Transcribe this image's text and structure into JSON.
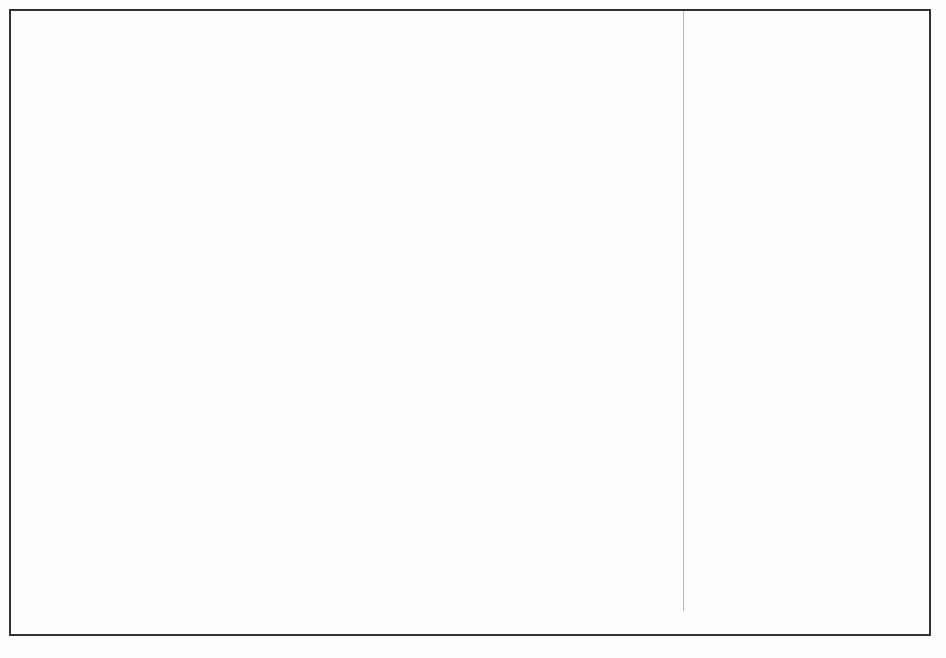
{
  "figure": {
    "caption": "Marine fishes not identified: 0.5%"
  },
  "chart_data": {
    "type": "area",
    "xlabel": "",
    "ylabel": "mt",
    "categories": [
      "1990",
      "1991",
      "1992",
      "1993",
      "1994",
      "1995",
      "1996",
      "1997",
      "1998",
      "1999"
    ],
    "x_tick_labels": [
      "1990",
      "1991",
      "1992",
      "1993",
      "1994",
      "1995",
      "1996",
      "1997",
      "1998",
      "1999"
    ],
    "y_tick_labels": [
      "0",
      "300,000",
      "600,000",
      "900,000",
      "1,200,000",
      "1,500,000",
      "1,800,000"
    ],
    "y_tick_values": [
      0,
      300000,
      600000,
      900000,
      1200000,
      1500000,
      1800000
    ],
    "ylim": [
      0,
      1800000
    ],
    "grid": false,
    "legend_position": "right",
    "stacked": true,
    "series": [
      {
        "name": "Molluscs",
        "color": "#f2f2f2",
        "values": [
          70000,
          55000,
          60000,
          62000,
          66000,
          70000,
          68000,
          66000,
          64000,
          62000
        ]
      },
      {
        "name": "Crustaceans",
        "color": "#bcbcbc",
        "values": [
          150000,
          155000,
          160000,
          168000,
          178000,
          190000,
          190000,
          196000,
          208000,
          216000
        ]
      },
      {
        "name": "Sharks, rays, chimaeras",
        "color": "#fbfbfb",
        "values": [
          12000,
          12000,
          13000,
          14000,
          15000,
          16000,
          16000,
          16000,
          17000,
          18000
        ]
      },
      {
        "name": "Miscellaneous pelagic fishes",
        "color": "#ffffff",
        "values": [
          82000,
          70000,
          60000,
          52000,
          46000,
          40000,
          40000,
          42000,
          46000,
          48000
        ]
      },
      {
        "name": "Tunas, bonitos, billfishes",
        "color": "#e8e8e8",
        "values": [
          6000,
          6000,
          6000,
          6000,
          6000,
          6000,
          6000,
          6000,
          6000,
          6000
        ]
      },
      {
        "name": "Herrings, sardines, anchovies",
        "color": "#8e8e8e",
        "values": [
          290000,
          240000,
          205000,
          190000,
          185000,
          180000,
          182000,
          186000,
          196000,
          200000
        ]
      },
      {
        "name": "Miscellaneous demersal fishes",
        "color": "#a8a8a8",
        "values": [
          65000,
          60000,
          58000,
          56000,
          55000,
          54000,
          55000,
          56000,
          58000,
          60000
        ]
      },
      {
        "name": "Miscellaneous coastal fishes",
        "color": "#fafafa",
        "values": [
          8000,
          8000,
          8000,
          8000,
          8000,
          8000,
          8000,
          8000,
          8000,
          8000
        ]
      },
      {
        "name": "Cods, hakes, haddocks",
        "color": "#cfcfcf",
        "values": [
          755000,
          545000,
          425000,
          320000,
          225000,
          160000,
          165000,
          175000,
          185000,
          180000
        ]
      },
      {
        "name": "Flounders, halibuts, soles",
        "color": "#ffffff",
        "values": [
          130000,
          110000,
          92000,
          78000,
          62000,
          48000,
          46000,
          45000,
          48000,
          50000
        ]
      },
      {
        "name": "Freshwater and diadromous fishes",
        "color": "#f7f7f7",
        "values": [
          12000,
          11000,
          10000,
          9000,
          8000,
          8000,
          8000,
          8000,
          9000,
          9000
        ]
      }
    ],
    "totals": [
      1580000,
      1272000,
      1097000,
      963000,
      834000,
      680000,
      684000,
      704000,
      745000,
      757000
    ],
    "annotation": "Marine fishes not identified: 0.5%"
  },
  "legend": {
    "items": [
      {
        "label": "Freshwater and diadromous fishes",
        "swatch": "#f7f7f7"
      },
      {
        "label": "Flounders, halibuts, soles",
        "swatch": "#ffffff"
      },
      {
        "label": "Cods, hakes, haddocks",
        "swatch": "#cfcfcf"
      },
      {
        "label": "Miscellaneous coastal fishes",
        "swatch": "#fafafa"
      },
      {
        "label": "Miscellaneous demersal fishes",
        "swatch": "#a8a8a8"
      },
      {
        "label": "Herrings, sardines, anchovies",
        "swatch": "#8e8e8e"
      },
      {
        "label": "Tunas, bonitos, billfishes",
        "swatch": "#e8e8e8"
      },
      {
        "label": "Miscellaneous pelagic fishes",
        "swatch": "#ffffff"
      },
      {
        "label": "Sharks, rays, chimaeras",
        "swatch": "#fbfbfb"
      },
      {
        "label": "Crustaceans",
        "swatch": "#bcbcbc"
      },
      {
        "label": "Molluscs",
        "swatch": "#f2f2f2"
      }
    ]
  }
}
